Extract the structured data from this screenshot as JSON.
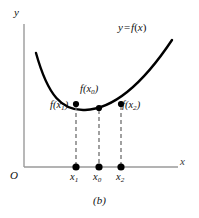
{
  "figure": {
    "caption": "(b)",
    "curve_label": {
      "y": "y",
      "equals": "=",
      "f": "f",
      "open": "(",
      "x": "x",
      "close": ")",
      "full": "y = f(x)"
    },
    "axes": {
      "y_label": "y",
      "x_label": "x",
      "origin_label": "O"
    },
    "colors": {
      "curve": "#000000",
      "axis": "#9a9a9a",
      "dashed_line": "#6f6f6f",
      "point": "#000000",
      "background": "#ffffff",
      "text": "#111111"
    },
    "curve_points": [
      {
        "name": "point-x1",
        "value_label_f": "f",
        "value_label_sub": "1",
        "value_label": "f(x₁)",
        "tick_label": "x₁",
        "tick_label_base": "x",
        "tick_label_sub": "1",
        "cx": 76,
        "cy": 104,
        "axis_y": 167
      },
      {
        "name": "point-x0",
        "value_label_f": "f",
        "value_label_sub": "0",
        "value_label": "f(x₀)",
        "tick_label": "x₀",
        "tick_label_base": "x",
        "tick_label_sub": "0",
        "cx": 99,
        "cy": 108,
        "axis_y": 167
      },
      {
        "name": "point-x2",
        "value_label_f": "f",
        "value_label_sub": "2",
        "value_label": "f(x₂)",
        "tick_label": "x₂",
        "tick_label_base": "x",
        "tick_label_sub": "2",
        "cx": 121,
        "cy": 104,
        "axis_y": 167
      }
    ],
    "geometry": {
      "y_axis_x": 24,
      "y_axis_top": 24,
      "x_axis_y": 167,
      "x_axis_right": 178,
      "curve_start": [
        36,
        53
      ],
      "curve_end": [
        172,
        40
      ],
      "curve_min_y": 110
    }
  }
}
